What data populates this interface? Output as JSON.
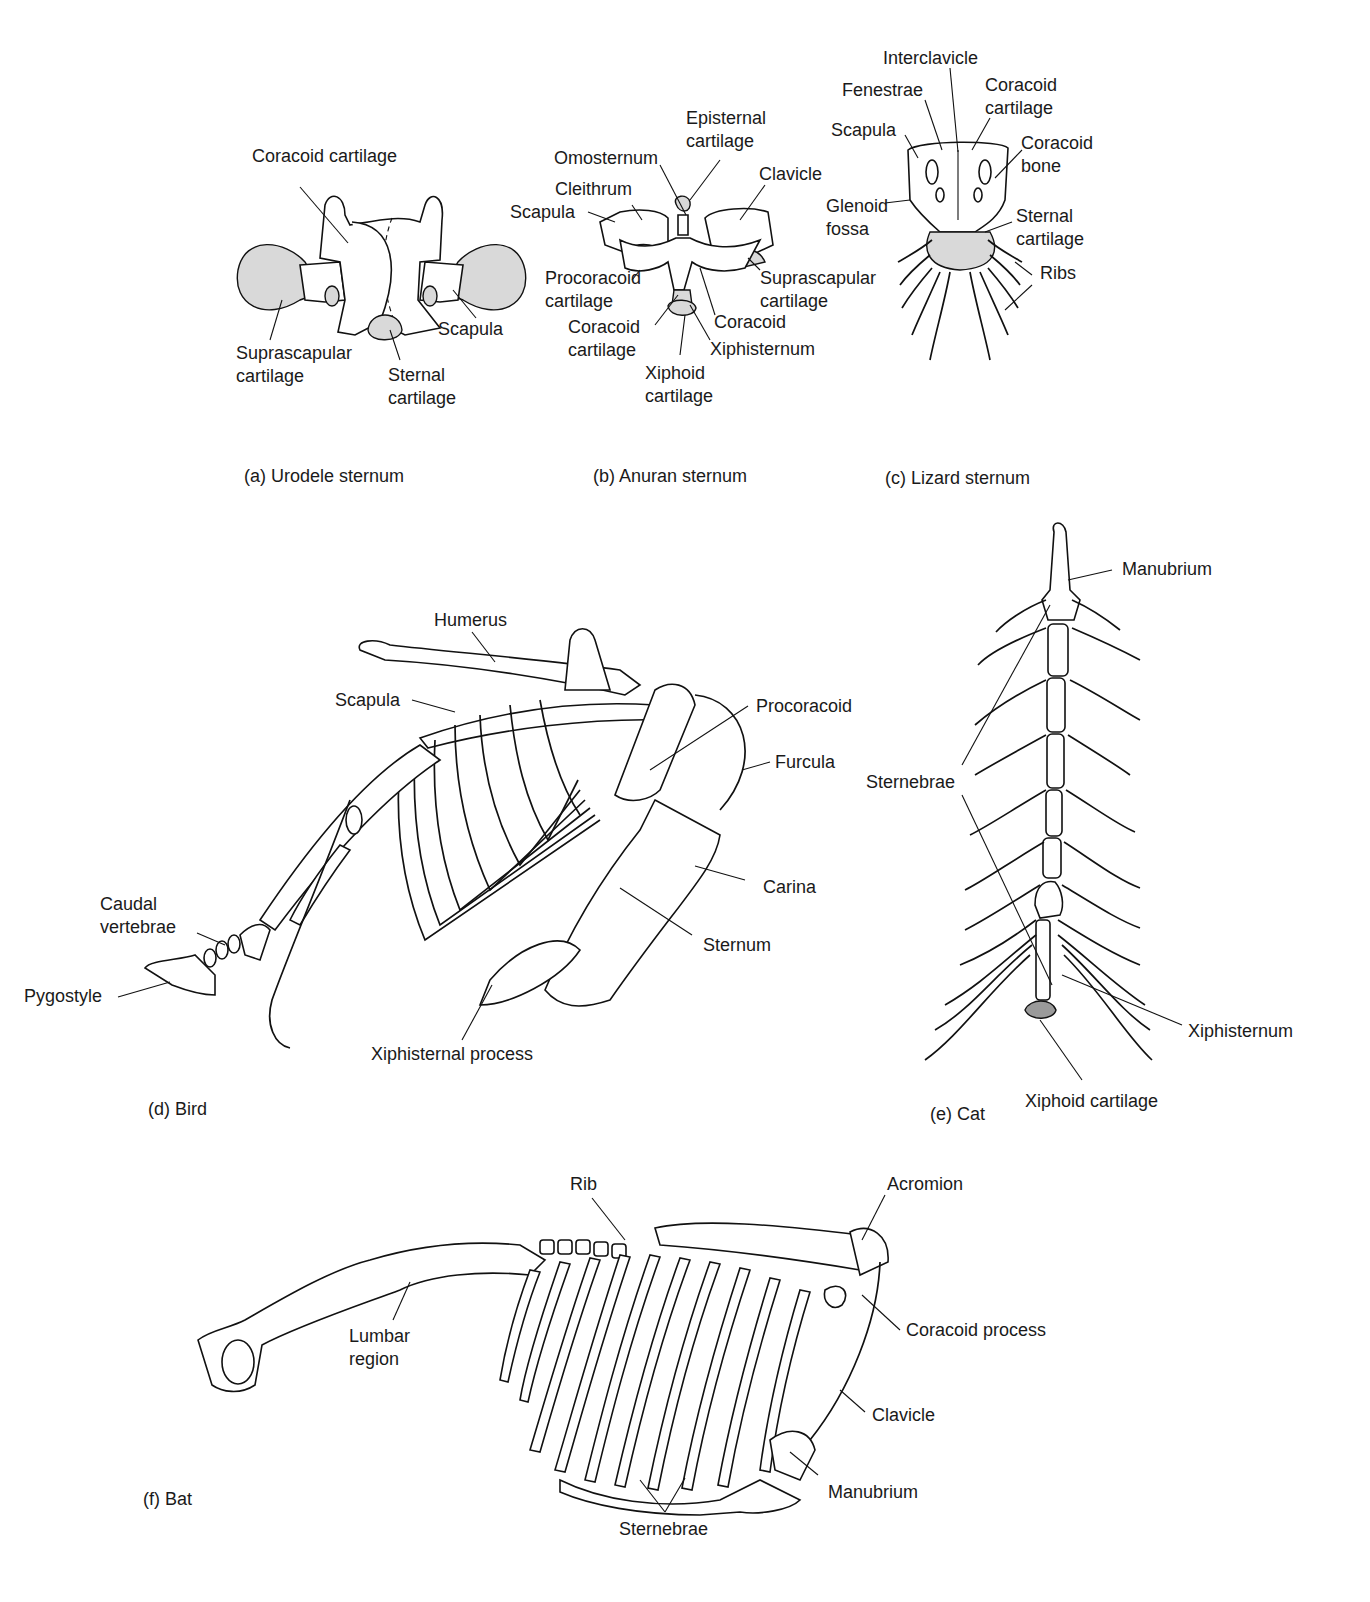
{
  "figure": {
    "panels": [
      {
        "id": "a",
        "caption": "(a) Urodele sternum",
        "labels": [
          "Coracoid cartilage",
          "Suprascapular\ncartilage",
          "Sternal\ncartilage",
          "Scapula"
        ]
      },
      {
        "id": "b",
        "caption": "(b) Anuran sternum",
        "labels": [
          "Episternal\ncartilage",
          "Omosternum",
          "Clavicle",
          "Cleithrum",
          "Scapula",
          "Procoracoid\ncartilage",
          "Suprascapular\ncartilage",
          "Coracoid\ncartilage",
          "Coracoid",
          "Xiphisternum",
          "Xiphoid\ncartilage"
        ]
      },
      {
        "id": "c",
        "caption": "(c) Lizard sternum",
        "labels": [
          "Interclavicle",
          "Fenestrae",
          "Coracoid\ncartilage",
          "Scapula",
          "Coracoid\nbone",
          "Glenoid\nfossa",
          "Sternal\ncartilage",
          "Ribs"
        ]
      },
      {
        "id": "d",
        "caption": "(d) Bird",
        "labels": [
          "Humerus",
          "Scapula",
          "Procoracoid",
          "Furcula",
          "Carina",
          "Sternum",
          "Caudal\nvertebrae",
          "Pygostyle",
          "Xiphisternal process"
        ]
      },
      {
        "id": "e",
        "caption": "(e) Cat",
        "labels": [
          "Manubrium",
          "Sternebrae",
          "Xiphisternum",
          "Xiphoid cartilage"
        ]
      },
      {
        "id": "f",
        "caption": "(f) Bat",
        "labels": [
          "Rib",
          "Acromion",
          "Lumbar\nregion",
          "Coracoid process",
          "Clavicle",
          "Manubrium",
          "Sternebrae"
        ]
      }
    ]
  }
}
